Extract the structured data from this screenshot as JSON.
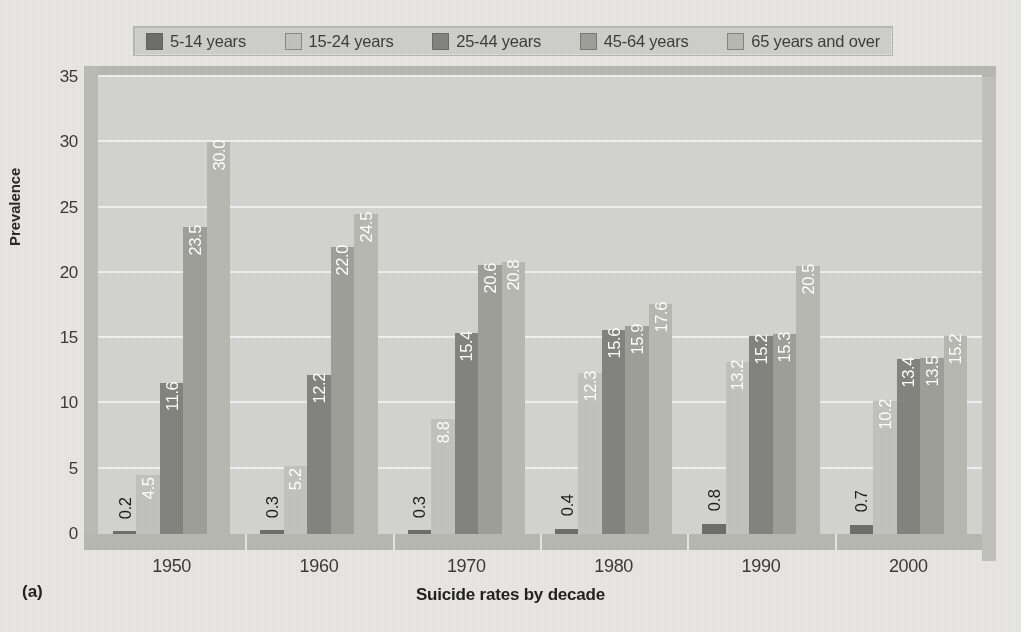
{
  "figure": {
    "panel_label": "(a)",
    "x_title": "Suicide rates by decade",
    "y_title": "Prevalence"
  },
  "legend": {
    "items": [
      {
        "label": "5-14 years",
        "color": "#6e6e6b"
      },
      {
        "label": "15-24 years",
        "color": "#c3c3bf"
      },
      {
        "label": "25-44 years",
        "color": "#84847f"
      },
      {
        "label": "45-64 years",
        "color": "#a0a09b"
      },
      {
        "label": "65 years and over",
        "color": "#b9b9b4"
      }
    ]
  },
  "chart_data": {
    "type": "bar",
    "title": "Suicide rates by decade",
    "xlabel": "Suicide rates by decade",
    "ylabel": "Prevalence",
    "ylim": [
      0,
      35
    ],
    "yticks": [
      0,
      5,
      10,
      15,
      20,
      25,
      30,
      35
    ],
    "grid": true,
    "legend_position": "top",
    "categories": [
      "1950",
      "1960",
      "1970",
      "1980",
      "1990",
      "2000"
    ],
    "series": [
      {
        "name": "5-14 years",
        "color": "#6e6e6b",
        "values": [
          0.2,
          0.3,
          0.3,
          0.4,
          0.8,
          0.7
        ]
      },
      {
        "name": "15-24 years",
        "color": "#c3c3bf",
        "values": [
          4.5,
          5.2,
          8.8,
          12.3,
          13.2,
          10.2
        ]
      },
      {
        "name": "25-44 years",
        "color": "#84847f",
        "values": [
          11.6,
          12.2,
          15.4,
          15.6,
          15.2,
          13.4
        ]
      },
      {
        "name": "45-64 years",
        "color": "#a0a09b",
        "values": [
          23.5,
          22.0,
          20.6,
          15.9,
          15.3,
          13.5
        ]
      },
      {
        "name": "65 years and over",
        "color": "#b9b9b4",
        "values": [
          30.0,
          24.5,
          20.8,
          17.6,
          20.5,
          15.2
        ]
      }
    ],
    "data_labels": [
      [
        "0.2",
        "4.5",
        "11.6",
        "23.5",
        "30.0"
      ],
      [
        "0.3",
        "5.2",
        "12.2",
        "22.0",
        "24.5"
      ],
      [
        "0.3",
        "8.8",
        "15.4",
        "20.6",
        "20.8"
      ],
      [
        "0.4",
        "12.3",
        "15.6",
        "15.9",
        "17.6"
      ],
      [
        "0.8",
        "13.2",
        "15.2",
        "15.3",
        "20.5"
      ],
      [
        "0.7",
        "10.2",
        "13.4",
        "13.5",
        "15.2"
      ]
    ]
  },
  "colors": {
    "plot_background": "#d4d4d0",
    "page_background": "#e8e7e4",
    "gridline": "#f0f0ee",
    "wall": "#b9b9b4"
  }
}
